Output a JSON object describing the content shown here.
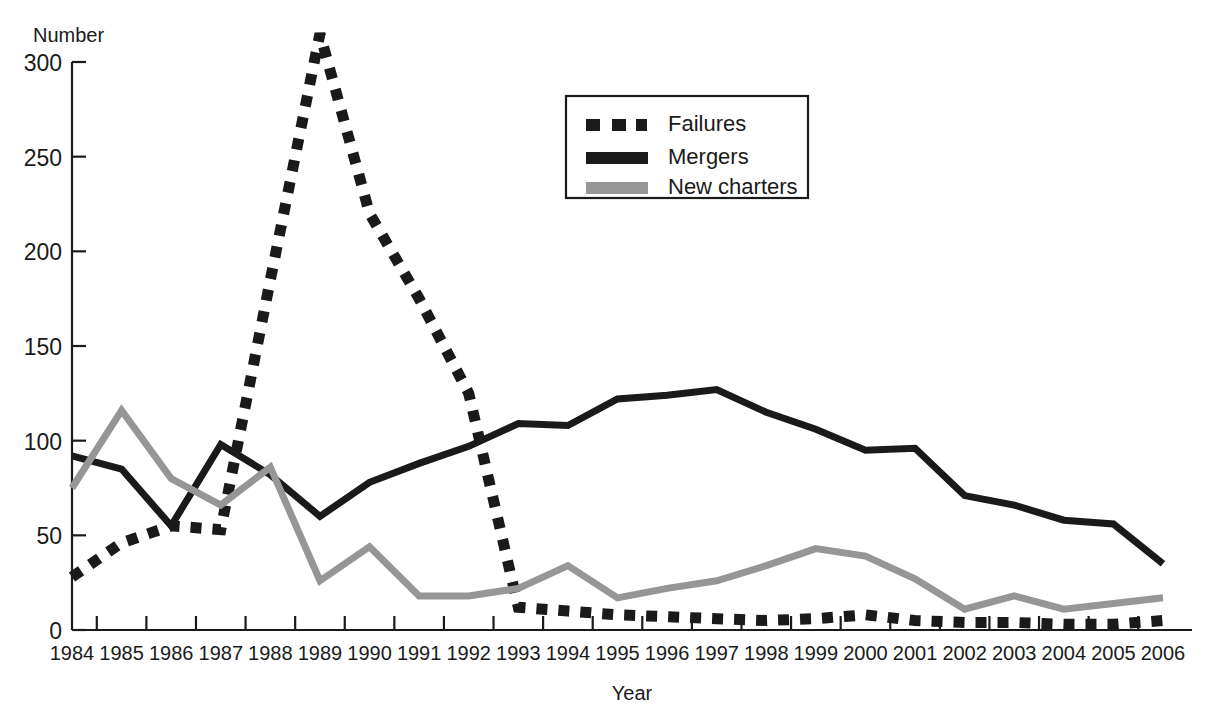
{
  "chart_data": {
    "type": "line",
    "title": "",
    "xlabel": "Year",
    "ylabel": "Number",
    "xlim": [
      1984,
      2006
    ],
    "ylim": [
      0,
      300
    ],
    "ytick_values": [
      0,
      50,
      100,
      150,
      200,
      250,
      300
    ],
    "ytick_labels": [
      "0",
      "50",
      "100",
      "150",
      "200",
      "250",
      "300"
    ],
    "grid": false,
    "legend_position": "top-center-right",
    "categories": [
      1984,
      1985,
      1986,
      1987,
      1988,
      1989,
      1990,
      1991,
      1992,
      1993,
      1994,
      1995,
      1996,
      1997,
      1998,
      1999,
      2000,
      2001,
      2002,
      2003,
      2004,
      2005,
      2006
    ],
    "xtick_labels": [
      "1984",
      "1985",
      "1986",
      "1987",
      "1988",
      "1989",
      "1990",
      "1991",
      "1992",
      "1993",
      "1994",
      "1995",
      "1996",
      "1997",
      "1998",
      "1999",
      "2000",
      "2001",
      "2002",
      "2003",
      "2004",
      "2005",
      "2006"
    ],
    "series": [
      {
        "name": "Failures",
        "style": "dotted",
        "color": "#1a1a1a",
        "values": [
          28,
          46,
          55,
          53,
          185,
          315,
          220,
          175,
          125,
          12,
          10,
          8,
          7,
          6,
          5,
          6,
          8,
          5,
          4,
          4,
          3,
          3,
          5
        ]
      },
      {
        "name": "Mergers",
        "style": "solid",
        "color": "#1a1a1a",
        "values": [
          92,
          85,
          55,
          98,
          82,
          60,
          78,
          88,
          97,
          109,
          108,
          122,
          124,
          127,
          115,
          106,
          95,
          96,
          71,
          66,
          58,
          56,
          35
        ]
      },
      {
        "name": "New charters",
        "style": "solid",
        "color": "#969696",
        "values": [
          75,
          116,
          80,
          66,
          86,
          26,
          44,
          18,
          18,
          22,
          34,
          17,
          22,
          26,
          34,
          43,
          39,
          27,
          11,
          18,
          11,
          14,
          17
        ]
      }
    ],
    "annotations": []
  },
  "legend": {
    "entries": [
      {
        "label": "Failures"
      },
      {
        "label": "Mergers"
      },
      {
        "label": "New charters"
      }
    ]
  },
  "axes": {
    "y_axis_title": "Number",
    "x_axis_title": "Year"
  }
}
